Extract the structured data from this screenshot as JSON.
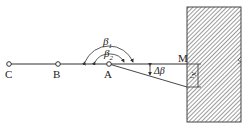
{
  "diagram": {
    "points": [
      {
        "id": "C",
        "label": "C",
        "x": 9,
        "y": 64
      },
      {
        "id": "B",
        "label": "B",
        "x": 58,
        "y": 64
      },
      {
        "id": "A",
        "label": "A",
        "x": 109,
        "y": 64
      },
      {
        "id": "M",
        "label": "M",
        "x": 187,
        "y": 64
      }
    ],
    "angles": {
      "beta1": {
        "label": "β",
        "sub": "1"
      },
      "beta2": {
        "label": "β",
        "sub": "2"
      },
      "delta_beta": {
        "label": "Δβ"
      }
    },
    "offset_label": {
      "label": "x",
      "sub": "1"
    },
    "wall": {
      "fill": "hatched",
      "color": "#555555"
    },
    "line_color": "#333333"
  }
}
